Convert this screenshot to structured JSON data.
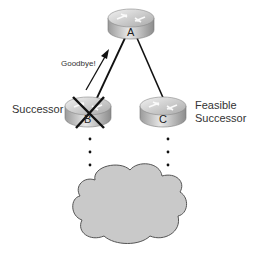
{
  "diagram": {
    "type": "network-topology",
    "nodes": [
      {
        "id": "A",
        "letter": "A",
        "role": "router"
      },
      {
        "id": "B",
        "letter": "B",
        "role": "router",
        "label": "Successor",
        "failed": true
      },
      {
        "id": "C",
        "letter": "C",
        "role": "router",
        "label_line1": "Feasible",
        "label_line2": "Successor"
      }
    ],
    "edges": [
      {
        "from": "B",
        "to": "A"
      },
      {
        "from": "C",
        "to": "A"
      }
    ],
    "message": {
      "text": "Goodbye!",
      "from": "B",
      "to": "A"
    },
    "cloud": {
      "label": ""
    },
    "colors": {
      "router_light": "#e6e6e6",
      "router_dark": "#8a8a8a",
      "cloud_fill": "#c9c9c9",
      "line": "#111111"
    }
  }
}
